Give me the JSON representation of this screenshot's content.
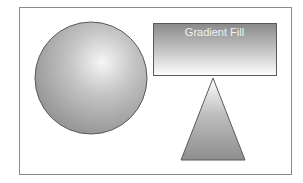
{
  "figure": {
    "rectangle": {
      "label": "Gradient Fill",
      "gradient": {
        "top": "#8c8c8c",
        "bottom": "#ffffff"
      },
      "stroke": "#555555"
    },
    "circle": {
      "gradient": {
        "highlight": "#f4f4f4",
        "edge": "#9a9a9a"
      },
      "stroke": "#555555"
    },
    "triangle": {
      "gradient": {
        "top": "#ffffff",
        "bottom": "#8e8e8e"
      },
      "stroke": "#555555"
    },
    "frame": {
      "stroke": "#8a8a8a"
    }
  }
}
